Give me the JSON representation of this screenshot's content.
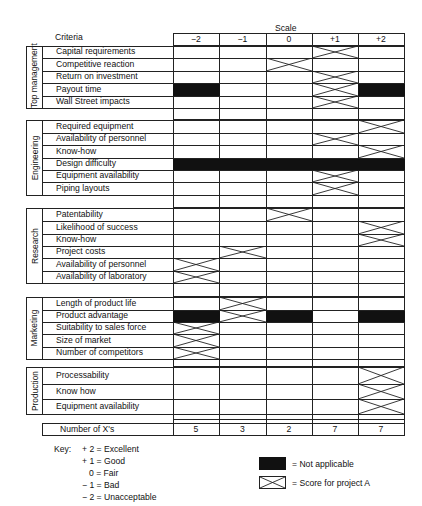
{
  "header": {
    "scale_title": "Scale",
    "criteria_title": "Criteria",
    "scale_columns": [
      "−2",
      "−1",
      "0",
      "+1",
      "+2"
    ]
  },
  "sections": [
    {
      "name": "Top management",
      "criteria": [
        {
          "label": "Capital requirements",
          "marks": {
            "x": [
              3
            ],
            "na": []
          }
        },
        {
          "label": "Competitive reaction",
          "marks": {
            "x": [
              2
            ],
            "na": []
          }
        },
        {
          "label": "Return on investment",
          "marks": {
            "x": [
              3
            ],
            "na": []
          }
        },
        {
          "label": "Payout time",
          "marks": {
            "x": [
              3
            ],
            "na": [
              0,
              4
            ]
          }
        },
        {
          "label": "Wall Street impacts",
          "marks": {
            "x": [
              3
            ],
            "na": []
          }
        }
      ]
    },
    {
      "name": "Engineering",
      "criteria": [
        {
          "label": "Required equipment",
          "marks": {
            "x": [
              4
            ],
            "na": []
          }
        },
        {
          "label": "Availability of personnel",
          "marks": {
            "x": [
              3
            ],
            "na": []
          }
        },
        {
          "label": "Know-how",
          "marks": {
            "x": [
              4
            ],
            "na": []
          }
        },
        {
          "label": "Design difficulty",
          "marks": {
            "x": [],
            "na": [
              0,
              1,
              2,
              3,
              4
            ]
          }
        },
        {
          "label": "Equipment availability",
          "marks": {
            "x": [
              3
            ],
            "na": []
          }
        },
        {
          "label": "Piping layouts",
          "marks": {
            "x": [
              3
            ],
            "na": []
          }
        }
      ]
    },
    {
      "name": "Research",
      "criteria": [
        {
          "label": "Patentability",
          "marks": {
            "x": [
              2
            ],
            "na": []
          }
        },
        {
          "label": "Likelihood of success",
          "marks": {
            "x": [
              4
            ],
            "na": []
          }
        },
        {
          "label": "Know-how",
          "marks": {
            "x": [
              4
            ],
            "na": []
          }
        },
        {
          "label": "Project costs",
          "marks": {
            "x": [
              1
            ],
            "na": []
          }
        },
        {
          "label": "Availability of personnel",
          "marks": {
            "x": [
              0
            ],
            "na": []
          }
        },
        {
          "label": "Availability of laboratory",
          "marks": {
            "x": [
              0
            ],
            "na": []
          }
        }
      ]
    },
    {
      "name": "Marketing",
      "criteria": [
        {
          "label": "Length of product life",
          "marks": {
            "x": [
              1
            ],
            "na": []
          }
        },
        {
          "label": "Product advantage",
          "marks": {
            "x": [
              1
            ],
            "na": [
              0,
              2,
              4
            ]
          }
        },
        {
          "label": "Suitability to sales force",
          "marks": {
            "x": [
              0
            ],
            "na": []
          }
        },
        {
          "label": "Size of market",
          "marks": {
            "x": [
              0
            ],
            "na": []
          }
        },
        {
          "label": "Number of competitors",
          "marks": {
            "x": [
              0
            ],
            "na": []
          }
        }
      ]
    },
    {
      "name": "Production",
      "criteria": [
        {
          "label": "Processability",
          "marks": {
            "x": [
              4
            ],
            "na": []
          }
        },
        {
          "label": "Know how",
          "marks": {
            "x": [
              4
            ],
            "na": []
          }
        },
        {
          "label": "Equipment availability",
          "marks": {
            "x": [
              4
            ],
            "na": []
          }
        }
      ]
    }
  ],
  "totals": {
    "label": "Number of X's",
    "values": [
      "5",
      "3",
      "2",
      "7",
      "7"
    ]
  },
  "key": {
    "title": "Key:",
    "items": [
      "+ 2 = Excellent",
      "+ 1 = Good",
      "0 = Fair",
      "− 1 = Bad",
      "− 2 = Unacceptable"
    ],
    "legend": [
      {
        "symbol": "filled-box",
        "label": "= Not applicable"
      },
      {
        "symbol": "x-box",
        "label": "= Score for project A"
      }
    ]
  }
}
